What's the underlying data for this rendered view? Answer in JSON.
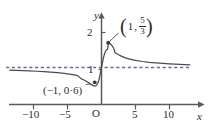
{
  "figure": {
    "kind": "coordinate-graph",
    "background_color": "#ffffff",
    "curve_color": "#4a4a4a",
    "axis_color": "#5a5a5a",
    "asymptote_color": "#6b6b95"
  },
  "axes": {
    "x_axis_name": "x",
    "y_axis_name": "y",
    "origin_label": "O",
    "x_tick_labels": [
      "−10",
      "−5",
      "5",
      "10"
    ],
    "y_tick_labels": [
      "1",
      "2"
    ]
  },
  "annotations": {
    "max_point": {
      "open_paren": "(",
      "x_value": "1",
      "comma": ",",
      "numerator": "5",
      "denominator": "3",
      "close_paren": ")"
    },
    "min_point": {
      "text": "(−1, 0·6)"
    }
  },
  "chart_data": {
    "type": "line",
    "title": "",
    "xlabel": "x",
    "ylabel": "y",
    "xlim": [
      -13.5,
      13.5
    ],
    "ylim": [
      -0.25,
      2.35
    ],
    "grid": false,
    "legend": null,
    "x_ticks": [
      -10,
      -5,
      5,
      10
    ],
    "y_ticks": [
      1,
      2
    ],
    "asymptotes": [
      {
        "kind": "horizontal",
        "value": 1,
        "style": "dashed",
        "label": ""
      }
    ],
    "annotated_points": [
      {
        "x": 1,
        "y": 1.6667,
        "label": "(1, 5/3)",
        "marker": "dot"
      },
      {
        "x": -1,
        "y": 0.6,
        "label": "(-1, 0·6)",
        "marker": "dot"
      }
    ],
    "series": [
      {
        "name": "y = (x^2 + x + 1)/(x^2 + 1)",
        "x": [
          -13.5,
          -12.5,
          -11.5,
          -10.5,
          -9.5,
          -8.5,
          -7.5,
          -6.5,
          -5.5,
          -4.5,
          -4.0,
          -3.5,
          -3.0,
          -2.5,
          -2.0,
          -1.75,
          -1.5,
          -1.25,
          -1.0,
          -0.85,
          -0.7,
          -0.55,
          -0.4,
          -0.25,
          -0.1,
          0.0,
          0.15,
          0.3,
          0.45,
          0.6,
          0.75,
          0.9,
          1.0,
          1.15,
          1.3,
          1.5,
          1.75,
          2.0,
          2.5,
          3.0,
          3.5,
          4.0,
          5.0,
          6.0,
          7.0,
          8.5,
          10.0,
          11.5,
          13.0,
          13.5
        ],
        "y": [
          0.9276,
          0.9218,
          0.9152,
          0.9076,
          0.8987,
          0.8882,
          0.8757,
          0.8603,
          0.8411,
          0.8162,
          0.8,
          0.7805,
          0.7,
          0.6552,
          0.6,
          0.5714,
          0.5385,
          0.5122,
          0.5,
          0.5029,
          0.5302,
          0.5802,
          0.6552,
          0.7647,
          0.9109,
          1.0,
          1.1467,
          1.2752,
          1.3719,
          1.4412,
          1.48,
          1.4972,
          1.6667,
          1.6602,
          1.6378,
          1.6,
          1.5385,
          1.4,
          1.3448,
          1.3,
          1.2585,
          1.2353,
          1.1923,
          1.1622,
          1.14,
          1.1172,
          1.099,
          1.0846,
          1.0741,
          1.0704
        ]
      }
    ]
  }
}
